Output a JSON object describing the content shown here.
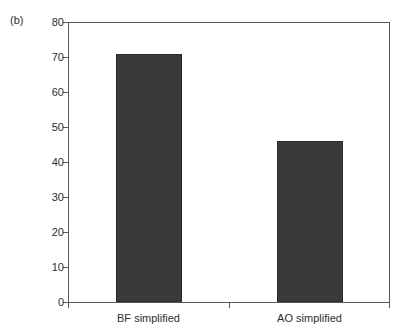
{
  "figure": {
    "panel_label": "(b)"
  },
  "chart_data": {
    "type": "bar",
    "title": "",
    "xlabel": "",
    "ylabel": "",
    "categories": [
      "BF simplified",
      "AO simplified"
    ],
    "values": [
      71,
      46
    ],
    "ylim": [
      0,
      80
    ],
    "yticks": [
      0,
      10,
      20,
      30,
      40,
      50,
      60,
      70,
      80
    ],
    "ytick_labels": [
      "0",
      "10",
      "20",
      "30",
      "40",
      "50",
      "60",
      "70",
      "80"
    ],
    "grid": false,
    "legend": null,
    "bar_color": "#3a3a3a",
    "axis_color": "#595959",
    "background": "#ffffff"
  }
}
